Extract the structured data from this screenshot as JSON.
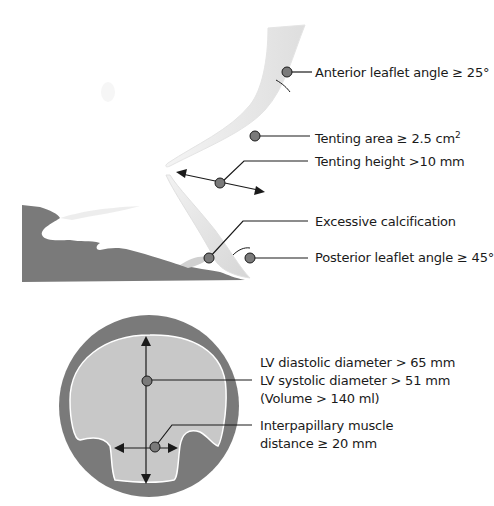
{
  "valve_panel": {
    "labels": {
      "anterior_angle": "Anterior leaflet angle ≥ 25°",
      "tenting_area": "Tenting area ≥ 2.5 cm",
      "tenting_area_sup": "2",
      "tenting_height": "Tenting height >10 mm",
      "calcification": "Excessive calcification",
      "posterior_angle": "Posterior leaflet angle ≥ 45°"
    }
  },
  "ventricle_panel": {
    "labels": {
      "diastolic": "LV diastolic diameter > 65 mm",
      "systolic": "LV systolic diameter > 51 mm",
      "volume": "(Volume > 140 ml)",
      "interpapillary_1": "Interpapillary muscle",
      "interpapillary_2": "distance ≥ 20 mm"
    }
  },
  "colors": {
    "tissue_dark": "#7a7a7a",
    "cavity_light": "#c8c8c8",
    "marker_fill": "#7a7a7a",
    "line": "#1a1a1a"
  }
}
